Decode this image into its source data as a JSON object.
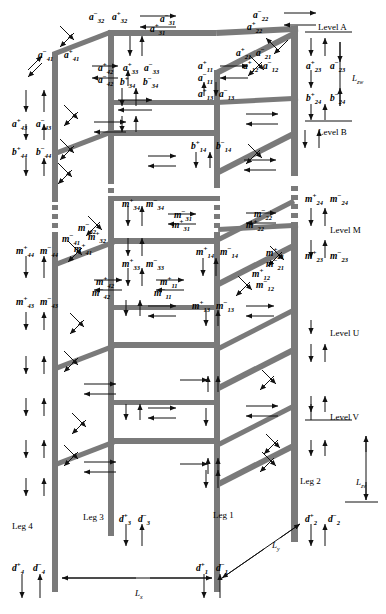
{
  "figure": {
    "levels": [
      {
        "name": "Level A",
        "x": 318,
        "y": 22
      },
      {
        "name": "Level B",
        "x": 318,
        "y": 127
      },
      {
        "name": "Level M",
        "x": 330,
        "y": 225
      },
      {
        "name": "Level U",
        "x": 330,
        "y": 328
      },
      {
        "name": "Level V",
        "x": 330,
        "y": 412
      }
    ],
    "legs": [
      {
        "name": "Leg 1",
        "x": 213,
        "y": 510
      },
      {
        "name": "Leg 2",
        "x": 300,
        "y": 476
      },
      {
        "name": "Leg 3",
        "x": 83,
        "y": 512
      },
      {
        "name": "Leg 4",
        "x": 12,
        "y": 521
      }
    ],
    "dimensions": [
      {
        "id": "Lzw",
        "base": "L",
        "sub": "zw",
        "x": 352,
        "y": 73
      },
      {
        "id": "Lzv",
        "base": "L",
        "sub": "zv",
        "x": 356,
        "y": 477
      },
      {
        "id": "Lx",
        "base": "L",
        "sub": "x",
        "x": 135,
        "y": 588
      },
      {
        "id": "Ly",
        "base": "L",
        "sub": "y",
        "x": 272,
        "y": 540
      }
    ],
    "labels_a": [
      {
        "base": "a",
        "sup": "−",
        "sub": "32",
        "x": 89,
        "y": 11
      },
      {
        "base": "a",
        "sup": "+",
        "sub": "32",
        "x": 112,
        "y": 11
      },
      {
        "base": "a",
        "sup": "−",
        "sub": "31",
        "x": 160,
        "y": 13
      },
      {
        "base": "a",
        "sup": "+",
        "sub": "31",
        "x": 150,
        "y": 23
      },
      {
        "base": "a",
        "sup": "−",
        "sub": "22",
        "x": 253,
        "y": 9
      },
      {
        "base": "a",
        "sup": "+",
        "sub": "22",
        "x": 247,
        "y": 21
      },
      {
        "base": "a",
        "sup": "−",
        "sub": "41",
        "x": 38,
        "y": 49
      },
      {
        "base": "a",
        "sup": "+",
        "sub": "41",
        "x": 64,
        "y": 49
      },
      {
        "base": "a",
        "sup": "+",
        "sub": "42",
        "x": 98,
        "y": 62
      },
      {
        "base": "a",
        "sup": "−",
        "sub": "42",
        "x": 98,
        "y": 74
      },
      {
        "base": "a",
        "sup": "+",
        "sub": "33",
        "x": 123,
        "y": 62
      },
      {
        "base": "a",
        "sup": "−",
        "sub": "33",
        "x": 144,
        "y": 62
      },
      {
        "base": "a",
        "sup": "+",
        "sub": "11",
        "x": 198,
        "y": 60
      },
      {
        "base": "a",
        "sup": "−",
        "sub": "11",
        "x": 198,
        "y": 72
      },
      {
        "base": "a",
        "sup": "+",
        "sub": "12",
        "x": 243,
        "y": 60
      },
      {
        "base": "a",
        "sup": "−",
        "sub": "12",
        "x": 263,
        "y": 60
      },
      {
        "base": "a",
        "sup": "+",
        "sub": "21",
        "x": 236,
        "y": 47
      },
      {
        "base": "a",
        "sup": "−",
        "sub": "21",
        "x": 256,
        "y": 47
      },
      {
        "base": "a",
        "sup": "+",
        "sub": "23",
        "x": 306,
        "y": 60
      },
      {
        "base": "a",
        "sup": "−",
        "sub": "23",
        "x": 330,
        "y": 60
      },
      {
        "base": "a",
        "sup": "+",
        "sub": "43",
        "x": 12,
        "y": 118
      },
      {
        "base": "a",
        "sup": "−",
        "sub": "43",
        "x": 36,
        "y": 118
      },
      {
        "base": "a",
        "sup": "+",
        "sub": "13",
        "x": 198,
        "y": 88
      },
      {
        "base": "a",
        "sup": "−",
        "sub": "13",
        "x": 219,
        "y": 88
      }
    ],
    "labels_b": [
      {
        "base": "b",
        "sup": "+",
        "sub": "34",
        "x": 120,
        "y": 76
      },
      {
        "base": "b",
        "sup": "−",
        "sub": "34",
        "x": 143,
        "y": 76
      },
      {
        "base": "b",
        "sup": "+",
        "sub": "24",
        "x": 306,
        "y": 92
      },
      {
        "base": "b",
        "sup": "−",
        "sub": "24",
        "x": 330,
        "y": 92
      },
      {
        "base": "b",
        "sup": "+",
        "sub": "44",
        "x": 12,
        "y": 146
      },
      {
        "base": "b",
        "sup": "−",
        "sub": "44",
        "x": 36,
        "y": 146
      },
      {
        "base": "b",
        "sup": "+",
        "sub": "14",
        "x": 191,
        "y": 140
      },
      {
        "base": "b",
        "sup": "−",
        "sub": "14",
        "x": 216,
        "y": 140
      }
    ],
    "labels_m": [
      {
        "base": "m",
        "sup": "+",
        "sub": "24",
        "x": 305,
        "y": 193
      },
      {
        "base": "m",
        "sup": "−",
        "sub": "24",
        "x": 330,
        "y": 193
      },
      {
        "base": "m",
        "sup": "+",
        "sub": "34",
        "x": 122,
        "y": 198
      },
      {
        "base": "m",
        "sup": "−",
        "sub": "34",
        "x": 146,
        "y": 198
      },
      {
        "base": "m",
        "sup": "−",
        "sub": "31",
        "x": 174,
        "y": 209
      },
      {
        "base": "m",
        "sup": "+",
        "sub": "31",
        "x": 172,
        "y": 219
      },
      {
        "base": "m",
        "sup": "−",
        "sub": "22",
        "x": 254,
        "y": 208
      },
      {
        "base": "m",
        "sup": "+",
        "sub": "22",
        "x": 246,
        "y": 219
      },
      {
        "base": "m",
        "sup": "−",
        "sub": "32",
        "x": 78,
        "y": 222
      },
      {
        "base": "m",
        "sup": "+",
        "sub": "32",
        "x": 88,
        "y": 231
      },
      {
        "base": "m",
        "sup": "−",
        "sub": "41",
        "x": 62,
        "y": 233
      },
      {
        "base": "m",
        "sup": "+",
        "sub": "41",
        "x": 74,
        "y": 243
      },
      {
        "base": "m",
        "sup": "+",
        "sub": "44",
        "x": 16,
        "y": 245
      },
      {
        "base": "m",
        "sup": "−",
        "sub": "44",
        "x": 40,
        "y": 245
      },
      {
        "base": "m",
        "sup": "+",
        "sub": "33",
        "x": 122,
        "y": 258
      },
      {
        "base": "m",
        "sup": "−",
        "sub": "33",
        "x": 146,
        "y": 258
      },
      {
        "base": "m",
        "sup": "+",
        "sub": "14",
        "x": 196,
        "y": 246
      },
      {
        "base": "m",
        "sup": "−",
        "sub": "14",
        "x": 220,
        "y": 246
      },
      {
        "base": "m",
        "sup": "+",
        "sub": "21",
        "x": 266,
        "y": 247
      },
      {
        "base": "m",
        "sup": "−",
        "sub": "21",
        "x": 266,
        "y": 258
      },
      {
        "base": "m",
        "sup": "+",
        "sub": "23",
        "x": 305,
        "y": 250
      },
      {
        "base": "m",
        "sup": "−",
        "sub": "23",
        "x": 330,
        "y": 250
      },
      {
        "base": "m",
        "sup": "+",
        "sub": "12",
        "x": 252,
        "y": 268
      },
      {
        "base": "m",
        "sup": "−",
        "sub": "12",
        "x": 256,
        "y": 279
      },
      {
        "base": "m",
        "sup": "+",
        "sub": "42",
        "x": 96,
        "y": 276
      },
      {
        "base": "m",
        "sup": "−",
        "sub": "42",
        "x": 92,
        "y": 287
      },
      {
        "base": "m",
        "sup": "+",
        "sub": "11",
        "x": 160,
        "y": 276
      },
      {
        "base": "m",
        "sup": "−",
        "sub": "11",
        "x": 154,
        "y": 287
      },
      {
        "base": "m",
        "sup": "+",
        "sub": "43",
        "x": 16,
        "y": 296
      },
      {
        "base": "m",
        "sup": "−",
        "sub": "43",
        "x": 40,
        "y": 296
      },
      {
        "base": "m",
        "sup": "+",
        "sub": "13",
        "x": 192,
        "y": 300
      },
      {
        "base": "m",
        "sup": "−",
        "sub": "13",
        "x": 216,
        "y": 300
      }
    ],
    "labels_d": [
      {
        "base": "d",
        "sup": "+",
        "sub": "3",
        "x": 119,
        "y": 513
      },
      {
        "base": "d",
        "sup": "−",
        "sub": "3",
        "x": 138,
        "y": 513
      },
      {
        "base": "d",
        "sup": "+",
        "sub": "2",
        "x": 305,
        "y": 513
      },
      {
        "base": "d",
        "sup": "−",
        "sub": "2",
        "x": 328,
        "y": 513
      },
      {
        "base": "d",
        "sup": "+",
        "sub": "4",
        "x": 12,
        "y": 562
      },
      {
        "base": "d",
        "sup": "−",
        "sub": "4",
        "x": 33,
        "y": 562
      },
      {
        "base": "d",
        "sup": "+",
        "sub": "1",
        "x": 196,
        "y": 562
      },
      {
        "base": "d",
        "sup": "−",
        "sub": "1",
        "x": 216,
        "y": 562
      }
    ]
  }
}
